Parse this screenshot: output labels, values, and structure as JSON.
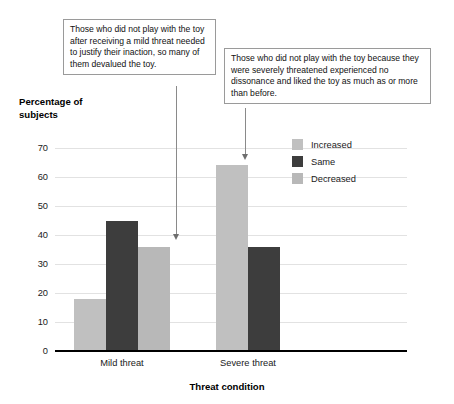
{
  "annotations": [
    {
      "id": "mild",
      "text": "Those who did not play with the toy after receiving a mild threat needed to justify their inaction, so many of them devalued the toy."
    },
    {
      "id": "severe",
      "text": "Those who did not play with the toy because they were severely threatened experienced no dissonance and liked the toy as much as or more than before."
    }
  ],
  "legend": {
    "items": [
      {
        "label": "Increased",
        "color": "#c0c0c0"
      },
      {
        "label": "Same",
        "color": "#3d3d3d"
      },
      {
        "label": "Decreased",
        "color": "#b8b8b8"
      }
    ]
  },
  "chart_data": {
    "type": "bar",
    "title": "",
    "xlabel": "Threat condition",
    "ylabel": "Percentage of subjects",
    "ylabel_lines": [
      "Percentage of",
      "subjects"
    ],
    "categories": [
      "Mild threat",
      "Severe threat"
    ],
    "series": [
      {
        "name": "Increased",
        "color": "#c0c0c0",
        "values": [
          18,
          64
        ]
      },
      {
        "name": "Same",
        "color": "#3d3d3d",
        "values": [
          45,
          36
        ]
      },
      {
        "name": "Decreased",
        "color": "#b8b8b8",
        "values": [
          36,
          0
        ]
      }
    ],
    "ylim": [
      0,
      70
    ],
    "yticks": [
      0,
      10,
      20,
      30,
      40,
      50,
      60,
      70
    ],
    "ytick_labels": [
      "0",
      "10",
      "20",
      "30",
      "40",
      "50",
      "60",
      "70"
    ],
    "grid": true,
    "legend_position": "upper right"
  }
}
